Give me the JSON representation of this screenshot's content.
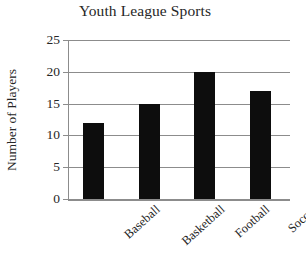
{
  "chart_data": {
    "type": "bar",
    "title": "Youth League Sports",
    "xlabel": "",
    "ylabel": "Number of Players",
    "categories": [
      "Baseball",
      "Basketball",
      "Football",
      "Soccer"
    ],
    "values": [
      12,
      15,
      20,
      17
    ],
    "ylim": [
      0,
      25
    ],
    "ytick_step": 5,
    "yticks": [
      0,
      5,
      10,
      15,
      20,
      25
    ],
    "ytick_labels": [
      "0",
      "5",
      "10",
      "15",
      "20",
      "25"
    ],
    "grid": "horizontal",
    "legend": "none",
    "bar_color": "#0d0d0d",
    "axis_color": "#8c8c8c",
    "background": "#ffffff",
    "xtick_label_rotation": -42
  },
  "chart": {
    "title": "Youth League Sports",
    "y_axis_title": "Number of Players",
    "y_ticks": [
      {
        "label": "25",
        "value": 25
      },
      {
        "label": "20",
        "value": 20
      },
      {
        "label": "15",
        "value": 15
      },
      {
        "label": "10",
        "value": 10
      },
      {
        "label": "5",
        "value": 5
      },
      {
        "label": "0",
        "value": 0
      }
    ],
    "bars": [
      {
        "label": "Baseball",
        "value": 12
      },
      {
        "label": "Basketball",
        "value": 15
      },
      {
        "label": "Football",
        "value": 20
      },
      {
        "label": "Soccer",
        "value": 17
      }
    ]
  }
}
